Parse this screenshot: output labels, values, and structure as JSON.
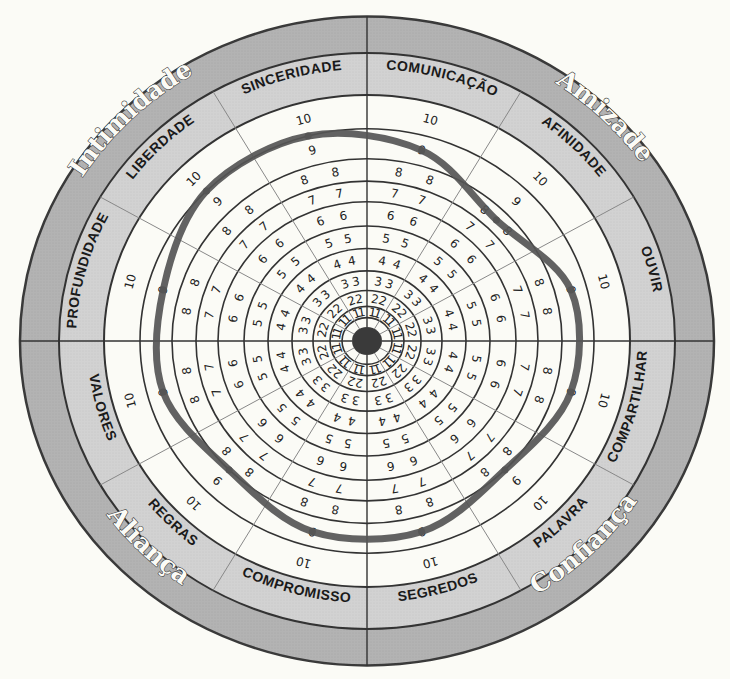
{
  "diagram": {
    "type": "radial-relationship-wheel",
    "scale": {
      "min": 1,
      "max": 10,
      "step": 1
    },
    "categories": [
      {
        "name": "Amizade",
        "sectors": [
          "COMUNICAÇÃO",
          "AFINIDADE",
          "OUVIR"
        ]
      },
      {
        "name": "Confiança",
        "sectors": [
          "COMPARTILHAR",
          "PALAVRA",
          "SEGREDOS"
        ]
      },
      {
        "name": "Aliança",
        "sectors": [
          "COMPROMISSO",
          "REGRAS",
          "VALORES"
        ]
      },
      {
        "name": "Intimidade",
        "sectors": [
          "PROFUNDIDADE",
          "LIBERDADE",
          "SINCERIDADE"
        ]
      }
    ],
    "sectors": [
      {
        "label": "COMUNICAÇÃO",
        "category": "Amizade",
        "value": 8.5
      },
      {
        "label": "AFINIDADE",
        "category": "Amizade",
        "value": 7.5
      },
      {
        "label": "OUVIR",
        "category": "Amizade",
        "value": 8.5
      },
      {
        "label": "COMPARTILHAR",
        "category": "Confiança",
        "value": 8.5
      },
      {
        "label": "PALAVRA",
        "category": "Confiança",
        "value": 8
      },
      {
        "label": "SEGREDOS",
        "category": "Confiança",
        "value": 8.5
      },
      {
        "label": "COMPROMISSO",
        "category": "Aliança",
        "value": 8.5
      },
      {
        "label": "REGRAS",
        "category": "Aliança",
        "value": 8
      },
      {
        "label": "VALORES",
        "category": "Aliança",
        "value": 8.5
      },
      {
        "label": "PROFUNDIDADE",
        "category": "Intimidade",
        "value": 8.5
      },
      {
        "label": "LIBERDADE",
        "category": "Intimidade",
        "value": 9
      },
      {
        "label": "SINCERIDADE",
        "category": "Intimidade",
        "value": 9
      }
    ],
    "ring_numbers": [
      "1",
      "2",
      "3",
      "4",
      "5",
      "6",
      "7",
      "8",
      "9",
      "10"
    ],
    "colors": {
      "background": "#fbfbf6",
      "outer_ring": "#b3b3b3",
      "sub_label_ring": "#d2d2d2",
      "grid_line": "#333333",
      "spoke_line": "#888888",
      "drawn_path": "#555555",
      "center_dot": "#3a3a3a"
    }
  }
}
